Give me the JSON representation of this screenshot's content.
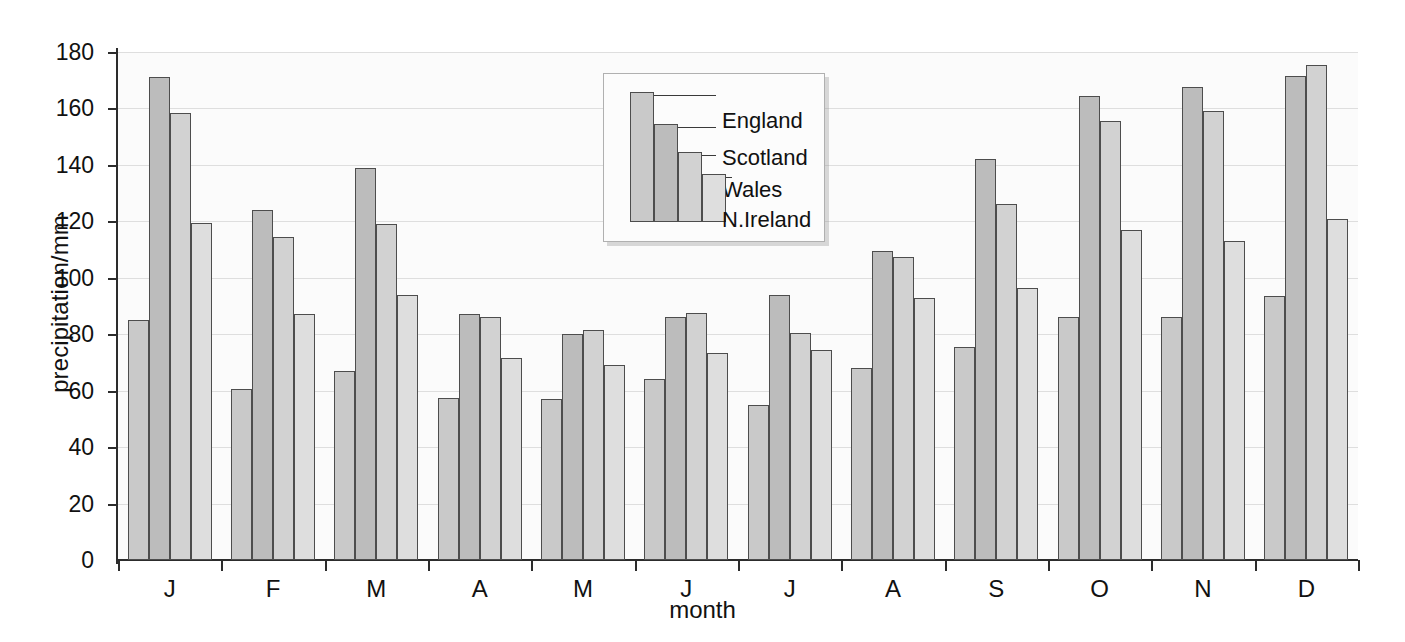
{
  "chart_data": {
    "type": "bar",
    "title": "",
    "xlabel": "month",
    "ylabel": "precipitation/mm",
    "ylim": [
      0,
      180
    ],
    "ytick_step": 20,
    "yticks": [
      0,
      20,
      40,
      60,
      80,
      100,
      120,
      140,
      160,
      180
    ],
    "grid": true,
    "legend_position": "inside-top-center",
    "categories": [
      "J",
      "F",
      "M",
      "A",
      "M",
      "J",
      "J",
      "A",
      "S",
      "O",
      "N",
      "D"
    ],
    "series": [
      {
        "name": "England",
        "color": "#c9c9c9",
        "values": [
          85,
          60.5,
          67,
          57.5,
          57,
          64,
          55,
          68,
          75.5,
          86,
          86,
          93.5
        ]
      },
      {
        "name": "Scotland",
        "color": "#bcbcbc",
        "values": [
          171,
          124,
          139,
          87,
          80,
          86,
          94,
          109.5,
          142,
          164.5,
          167.5,
          171.5
        ]
      },
      {
        "name": "Wales",
        "color": "#d2d2d2",
        "values": [
          158.5,
          114.5,
          119,
          86,
          81.5,
          87.5,
          80.5,
          107.5,
          126,
          155.5,
          159,
          175.5
        ]
      },
      {
        "name": "N.Ireland",
        "color": "#dedede",
        "values": [
          119.5,
          87,
          94,
          71.5,
          69,
          73.5,
          74.5,
          93,
          96.5,
          117,
          113,
          121
        ]
      }
    ]
  },
  "legend": {
    "items": [
      {
        "label": "England"
      },
      {
        "label": "Scotland"
      },
      {
        "label": "Wales"
      },
      {
        "label": "N.Ireland"
      }
    ]
  },
  "axes": {
    "y_title": "precipitation/mm",
    "x_title": "month"
  }
}
